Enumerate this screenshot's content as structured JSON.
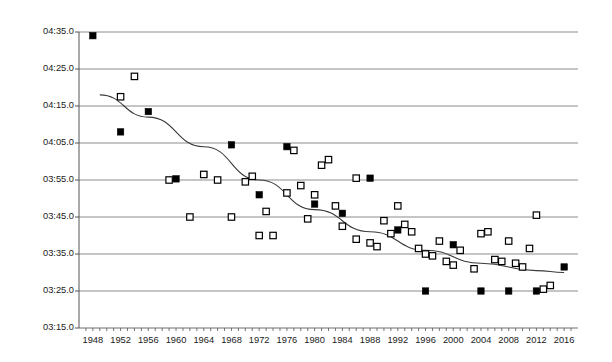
{
  "chart_data": {
    "type": "scatter",
    "title": "",
    "subtitle": "",
    "xlabel": "",
    "ylabel": "Aika (hh:mm:ss)",
    "xlim": [
      1946,
      2018
    ],
    "ylim_seconds": [
      195,
      275
    ],
    "ylim_labels": [
      "03:15.0",
      "04:35.0"
    ],
    "grid": true,
    "grid_axis": "y",
    "legend": "none",
    "y_tick_labels": [
      "04:35.0",
      "04:25.0",
      "04:15.0",
      "04:05.0",
      "03:55.0",
      "03:45.0",
      "03:35.0",
      "03:25.0",
      "03:15.0"
    ],
    "y_tick_seconds": [
      275,
      265,
      255,
      245,
      235,
      225,
      215,
      205,
      195
    ],
    "x_tick_labels": [
      "1948",
      "1952",
      "1956",
      "1960",
      "1964",
      "1968",
      "1972",
      "1976",
      "1980",
      "1984",
      "1988",
      "1992",
      "1996",
      "2000",
      "2004",
      "2008",
      "2012",
      "2016"
    ],
    "x_minor_tick_step": 1,
    "series": [
      {
        "name": "men",
        "marker": "filled-square",
        "color": "#000000",
        "points": [
          {
            "x": 1948,
            "y_seconds": 274.0,
            "y_label": "04:34.0"
          },
          {
            "x": 1952,
            "y_seconds": 248.0,
            "y_label": "04:08.0"
          },
          {
            "x": 1956,
            "y_seconds": 253.5,
            "y_label": "04:13.5"
          },
          {
            "x": 1960,
            "y_seconds": 235.3,
            "y_label": "03:55.3"
          },
          {
            "x": 1964,
            "y_seconds": 236.5,
            "y_label": "03:56.5"
          },
          {
            "x": 1968,
            "y_seconds": 244.5,
            "y_label": "04:04.5"
          },
          {
            "x": 1972,
            "y_seconds": 231.0,
            "y_label": "03:51.0"
          },
          {
            "x": 1976,
            "y_seconds": 244.0,
            "y_label": "04:04.0"
          },
          {
            "x": 1980,
            "y_seconds": 228.5,
            "y_label": "03:48.5"
          },
          {
            "x": 1984,
            "y_seconds": 226.0,
            "y_label": "03:46.0"
          },
          {
            "x": 1988,
            "y_seconds": 235.5,
            "y_label": "03:55.5"
          },
          {
            "x": 1992,
            "y_seconds": 221.5,
            "y_label": "03:41.5"
          },
          {
            "x": 1996,
            "y_seconds": 205.0,
            "y_label": "03:25.0"
          },
          {
            "x": 2000,
            "y_seconds": 217.5,
            "y_label": "03:37.5"
          },
          {
            "x": 2004,
            "y_seconds": 205.0,
            "y_label": "03:25.0"
          },
          {
            "x": 2008,
            "y_seconds": 205.0,
            "y_label": "03:25.0"
          },
          {
            "x": 2012,
            "y_seconds": 205.0,
            "y_label": "03:25.0"
          },
          {
            "x": 2016,
            "y_seconds": 211.5,
            "y_label": "03:31.5"
          }
        ]
      },
      {
        "name": "women",
        "marker": "open-square",
        "color": "#000000",
        "points": [
          {
            "x": 1952,
            "y_seconds": 257.5,
            "y_label": "04:17.5"
          },
          {
            "x": 1954,
            "y_seconds": 263.0,
            "y_label": "04:23.0"
          },
          {
            "x": 1970,
            "y_seconds": 234.5,
            "y_label": "03:54.5"
          },
          {
            "x": 1971,
            "y_seconds": 236.0,
            "y_label": "03:56.0"
          },
          {
            "x": 1966,
            "y_seconds": 235.0,
            "y_label": "03:55.0"
          },
          {
            "x": 1968,
            "y_seconds": 225.0,
            "y_label": "03:45.0"
          },
          {
            "x": 1973,
            "y_seconds": 226.5,
            "y_label": "03:46.5"
          },
          {
            "x": 1974,
            "y_seconds": 220.0,
            "y_label": "03:40.0"
          },
          {
            "x": 1977,
            "y_seconds": 243.0,
            "y_label": "04:03.0"
          },
          {
            "x": 1978,
            "y_seconds": 233.5,
            "y_label": "03:53.5"
          },
          {
            "x": 1979,
            "y_seconds": 224.5,
            "y_label": "03:44.5"
          },
          {
            "x": 1980,
            "y_seconds": 231.0,
            "y_label": "03:51.0"
          },
          {
            "x": 1981,
            "y_seconds": 239.0,
            "y_label": "03:59.0"
          },
          {
            "x": 1982,
            "y_seconds": 240.5,
            "y_label": "04:00.5"
          },
          {
            "x": 1983,
            "y_seconds": 228.0,
            "y_label": "03:48.0"
          },
          {
            "x": 1984,
            "y_seconds": 222.5,
            "y_label": "03:42.5"
          },
          {
            "x": 1986,
            "y_seconds": 235.5,
            "y_label": "03:55.5"
          },
          {
            "x": 1988,
            "y_seconds": 218.0,
            "y_label": "03:38.0"
          },
          {
            "x": 1989,
            "y_seconds": 217.0,
            "y_label": "03:37.0"
          },
          {
            "x": 1990,
            "y_seconds": 224.0,
            "y_label": "03:44.0"
          },
          {
            "x": 1991,
            "y_seconds": 220.5,
            "y_label": "03:40.5"
          },
          {
            "x": 1992,
            "y_seconds": 228.0,
            "y_label": "03:48.0"
          },
          {
            "x": 1993,
            "y_seconds": 223.0,
            "y_label": "03:43.0"
          },
          {
            "x": 1994,
            "y_seconds": 221.0,
            "y_label": "03:41.0"
          },
          {
            "x": 1995,
            "y_seconds": 216.5,
            "y_label": "03:36.5"
          },
          {
            "x": 1996,
            "y_seconds": 215.0,
            "y_label": "03:35.0"
          },
          {
            "x": 1997,
            "y_seconds": 214.5,
            "y_label": "03:34.5"
          },
          {
            "x": 1998,
            "y_seconds": 218.5,
            "y_label": "03:38.5"
          },
          {
            "x": 1999,
            "y_seconds": 213.0,
            "y_label": "03:33.0"
          },
          {
            "x": 2000,
            "y_seconds": 212.0,
            "y_label": "03:32.0"
          },
          {
            "x": 2001,
            "y_seconds": 216.0,
            "y_label": "03:36.0"
          },
          {
            "x": 2003,
            "y_seconds": 211.0,
            "y_label": "03:31.0"
          },
          {
            "x": 2004,
            "y_seconds": 220.5,
            "y_label": "03:40.5"
          },
          {
            "x": 2005,
            "y_seconds": 221.0,
            "y_label": "03:41.0"
          },
          {
            "x": 2006,
            "y_seconds": 213.5,
            "y_label": "03:33.5"
          },
          {
            "x": 2007,
            "y_seconds": 213.0,
            "y_label": "03:33.0"
          },
          {
            "x": 2008,
            "y_seconds": 218.5,
            "y_label": "03:38.5"
          },
          {
            "x": 2009,
            "y_seconds": 212.5,
            "y_label": "03:32.5"
          },
          {
            "x": 2010,
            "y_seconds": 211.5,
            "y_label": "03:31.5"
          },
          {
            "x": 2011,
            "y_seconds": 216.5,
            "y_label": "03:36.5"
          },
          {
            "x": 2012,
            "y_seconds": 225.5,
            "y_label": "03:45.5"
          },
          {
            "x": 2013,
            "y_seconds": 205.5,
            "y_label": "03:25.5"
          },
          {
            "x": 2014,
            "y_seconds": 206.5,
            "y_label": "03:26.5"
          },
          {
            "x": 1964,
            "y_seconds": 236.5,
            "y_label": "03:56.5"
          },
          {
            "x": 1962,
            "y_seconds": 225.0,
            "y_label": "03:45.0"
          },
          {
            "x": 1959,
            "y_seconds": 235.0,
            "y_label": "03:55.0"
          },
          {
            "x": 1972,
            "y_seconds": 220.0,
            "y_label": "03:40.0"
          },
          {
            "x": 1976,
            "y_seconds": 231.5,
            "y_label": "03:51.5"
          },
          {
            "x": 1986,
            "y_seconds": 219.0,
            "y_label": "03:39.0"
          }
        ]
      }
    ],
    "trendline": {
      "name": "fitted-curve",
      "type": "polynomial",
      "color": "#3a3a3a",
      "points": [
        {
          "x": 1949,
          "y_seconds": 258.0
        },
        {
          "x": 1956,
          "y_seconds": 252.0
        },
        {
          "x": 1964,
          "y_seconds": 244.0
        },
        {
          "x": 1972,
          "y_seconds": 235.0
        },
        {
          "x": 1980,
          "y_seconds": 227.0
        },
        {
          "x": 1988,
          "y_seconds": 221.0
        },
        {
          "x": 1996,
          "y_seconds": 216.0
        },
        {
          "x": 2004,
          "y_seconds": 212.5
        },
        {
          "x": 2012,
          "y_seconds": 210.5
        },
        {
          "x": 2016,
          "y_seconds": 210.0
        }
      ]
    }
  }
}
